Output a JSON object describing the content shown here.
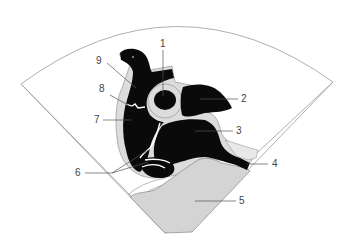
{
  "diagram": {
    "type": "echocardiogram-sector-schematic",
    "colors": {
      "sector_outline": "#9a9a9a",
      "chamber_fill": "#0a0a0a",
      "tissue_fill": "#dcdcdc",
      "liver_fill": "#d4d4d4",
      "background": "#ffffff",
      "leader_line": "#555555",
      "label_text": "#444444"
    },
    "labels": [
      {
        "id": "1",
        "text": "1"
      },
      {
        "id": "2",
        "text": "2"
      },
      {
        "id": "3",
        "text": "3"
      },
      {
        "id": "4",
        "text": "4"
      },
      {
        "id": "5",
        "text": "5"
      },
      {
        "id": "6",
        "text": "6"
      },
      {
        "id": "7",
        "text": "7"
      },
      {
        "id": "8",
        "text": "8"
      },
      {
        "id": "9",
        "text": "9"
      }
    ]
  }
}
